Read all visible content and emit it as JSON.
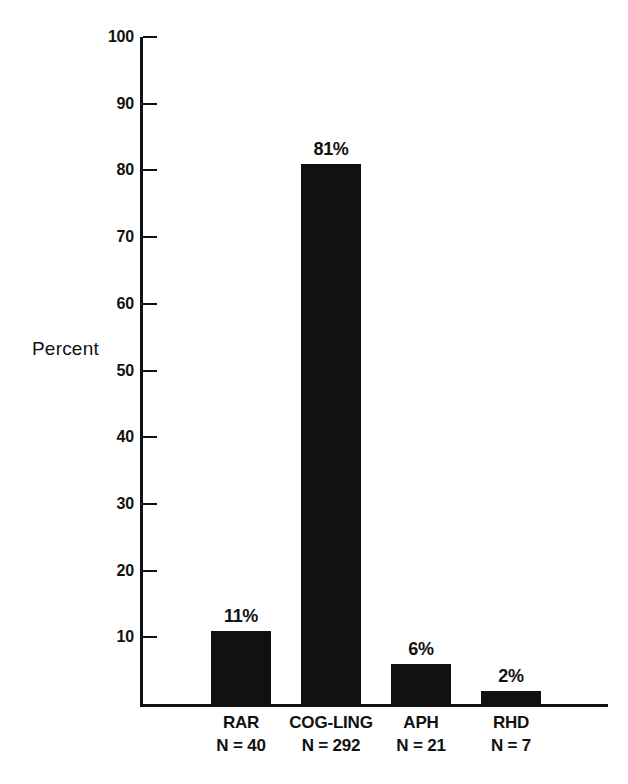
{
  "chart_data": {
    "type": "bar",
    "title": "",
    "subtitle": "",
    "xlabel": "",
    "ylabel": "Percent",
    "ylim": [
      0,
      100
    ],
    "yticks": [
      0,
      10,
      20,
      30,
      40,
      50,
      60,
      70,
      80,
      90,
      100
    ],
    "ytick_labels": [
      "10",
      "20",
      "30",
      "40",
      "50",
      "60",
      "70",
      "80",
      "90",
      "100"
    ],
    "grid": false,
    "legend": null,
    "categories": [
      "RAR",
      "COG-LING",
      "APH",
      "RHD"
    ],
    "values": [
      11,
      81,
      6,
      2
    ],
    "data_labels": [
      "11%",
      "81%",
      "6%",
      "2%"
    ],
    "group_sizes": [
      "N = 40",
      "N = 292",
      "N = 21",
      "N = 7"
    ],
    "bar_color": "#111111",
    "axis_color": "#111111",
    "background_color": "#ffffff",
    "points": [
      {
        "category": "RAR",
        "value": 11,
        "label": "11%",
        "n": "N = 40"
      },
      {
        "category": "COG-LING",
        "value": 81,
        "label": "81%",
        "n": "N = 292"
      },
      {
        "category": "APH",
        "value": 6,
        "label": "6%",
        "n": "N = 21"
      },
      {
        "category": "RHD",
        "value": 2,
        "label": "2%",
        "n": "N = 7"
      }
    ]
  },
  "axis": {
    "y_title": "Percent",
    "ticks": [
      {
        "value": 100,
        "label": "100"
      },
      {
        "value": 90,
        "label": "90"
      },
      {
        "value": 80,
        "label": "80"
      },
      {
        "value": 70,
        "label": "70"
      },
      {
        "value": 60,
        "label": "60"
      },
      {
        "value": 50,
        "label": "50"
      },
      {
        "value": 40,
        "label": "40"
      },
      {
        "value": 30,
        "label": "30"
      },
      {
        "value": 20,
        "label": "20"
      },
      {
        "value": 10,
        "label": "10"
      }
    ]
  }
}
